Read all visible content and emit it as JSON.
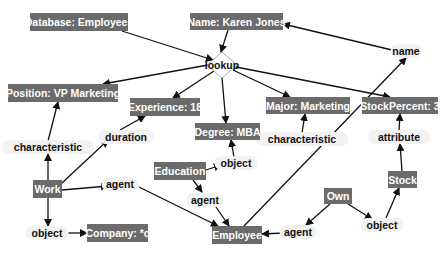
{
  "diagram": {
    "type": "conceptual-graph",
    "concepts": [
      {
        "id": "database",
        "label": "Database: Employees",
        "x": 30,
        "y": 13,
        "w": 98,
        "h": 18
      },
      {
        "id": "name_karen",
        "label": "Name: Karen Jones",
        "x": 190,
        "y": 13,
        "w": 93,
        "h": 17
      },
      {
        "id": "position",
        "label": "Position: VP Marketing",
        "x": 8,
        "y": 84,
        "w": 110,
        "h": 18
      },
      {
        "id": "experience",
        "label": "Experience: 18",
        "x": 130,
        "y": 98,
        "w": 70,
        "h": 18
      },
      {
        "id": "major",
        "label": "Major: Marketing",
        "x": 266,
        "y": 97,
        "w": 84,
        "h": 17
      },
      {
        "id": "stockpercent",
        "label": "StockPercent: 3",
        "x": 362,
        "y": 97,
        "w": 76,
        "h": 17
      },
      {
        "id": "degree",
        "label": "Degree: MBA",
        "x": 195,
        "y": 123,
        "w": 65,
        "h": 17
      },
      {
        "id": "education",
        "label": "Education",
        "x": 154,
        "y": 162,
        "w": 52,
        "h": 18
      },
      {
        "id": "work",
        "label": "Work",
        "x": 33,
        "y": 180,
        "w": 29,
        "h": 18
      },
      {
        "id": "stock",
        "label": "Stock",
        "x": 388,
        "y": 171,
        "w": 29,
        "h": 17
      },
      {
        "id": "own",
        "label": "Own",
        "x": 324,
        "y": 188,
        "w": 28,
        "h": 16
      },
      {
        "id": "company",
        "label": "Company: *c",
        "x": 87,
        "y": 224,
        "w": 61,
        "h": 18
      },
      {
        "id": "employee",
        "label": "Employee",
        "x": 212,
        "y": 226,
        "w": 50,
        "h": 18
      }
    ],
    "actor": {
      "id": "lookup",
      "label": "lookup",
      "cx": 222,
      "cy": 65,
      "rx": 15,
      "ry": 13
    },
    "relations": [
      {
        "id": "rel_name",
        "label": "name",
        "x": 406,
        "y": 51
      },
      {
        "id": "rel_char_left",
        "label": "characteristic",
        "x": 48,
        "y": 147
      },
      {
        "id": "rel_duration",
        "label": "duration",
        "x": 126,
        "y": 137
      },
      {
        "id": "rel_char_right",
        "label": "characteristic",
        "x": 302,
        "y": 139
      },
      {
        "id": "rel_attribute",
        "label": "attribute",
        "x": 399,
        "y": 137
      },
      {
        "id": "rel_object_edu",
        "label": "object",
        "x": 236,
        "y": 163
      },
      {
        "id": "rel_agent_work",
        "label": "agent",
        "x": 120,
        "y": 184
      },
      {
        "id": "rel_agent_edu",
        "label": "agent",
        "x": 205,
        "y": 200
      },
      {
        "id": "rel_object_work",
        "label": "object",
        "x": 47,
        "y": 233
      },
      {
        "id": "rel_agent_own",
        "label": "agent",
        "x": 298,
        "y": 232
      },
      {
        "id": "rel_object_own",
        "label": "object",
        "x": 382,
        "y": 225
      }
    ],
    "edges": [
      {
        "from": [
          122,
          31
        ],
        "to": [
          213,
          60
        ]
      },
      {
        "from": [
          228,
          30
        ],
        "to": [
          221,
          52
        ]
      },
      {
        "from": [
          208,
          65
        ],
        "to": [
          103,
          84
        ]
      },
      {
        "from": [
          214,
          71
        ],
        "to": [
          173,
          98
        ]
      },
      {
        "from": [
          222,
          78
        ],
        "to": [
          226,
          123
        ]
      },
      {
        "from": [
          233,
          70
        ],
        "to": [
          290,
          97
        ]
      },
      {
        "from": [
          236,
          67
        ],
        "to": [
          390,
          97
        ]
      },
      {
        "from": [
          392,
          50
        ],
        "to": [
          283,
          24
        ]
      },
      {
        "from": [
          48,
          141
        ],
        "to": [
          58,
          102
        ]
      },
      {
        "from": [
          120,
          130
        ],
        "to": [
          145,
          116
        ]
      },
      {
        "from": [
          302,
          133
        ],
        "to": [
          305,
          114
        ]
      },
      {
        "from": [
          399,
          131
        ],
        "to": [
          400,
          114
        ]
      },
      {
        "from": [
          48,
          180
        ],
        "to": [
          48,
          154
        ]
      },
      {
        "from": [
          62,
          183
        ],
        "to": [
          108,
          140
        ]
      },
      {
        "from": [
          62,
          190
        ],
        "to": [
          108,
          186
        ]
      },
      {
        "from": [
          48,
          198
        ],
        "to": [
          48,
          226
        ]
      },
      {
        "from": [
          63,
          233
        ],
        "to": [
          87,
          233
        ]
      },
      {
        "from": [
          139,
          187
        ],
        "to": [
          218,
          226
        ]
      },
      {
        "from": [
          206,
          170
        ],
        "to": [
          221,
          165
        ]
      },
      {
        "from": [
          234,
          157
        ],
        "to": [
          231,
          140
        ]
      },
      {
        "from": [
          193,
          180
        ],
        "to": [
          202,
          192
        ]
      },
      {
        "from": [
          216,
          207
        ],
        "to": [
          229,
          226
        ]
      },
      {
        "from": [
          260,
          140
        ],
        "to": [
          276,
          139
        ]
      },
      {
        "from": [
          244,
          226
        ],
        "to": [
          406,
          58
        ]
      },
      {
        "from": [
          284,
          233
        ],
        "to": [
          262,
          234
        ]
      },
      {
        "from": [
          330,
          204
        ],
        "to": [
          306,
          225
        ]
      },
      {
        "from": [
          348,
          204
        ],
        "to": [
          372,
          219
        ]
      },
      {
        "from": [
          386,
          218
        ],
        "to": [
          399,
          188
        ]
      },
      {
        "from": [
          402,
          171
        ],
        "to": [
          400,
          144
        ]
      }
    ],
    "colors": {
      "concept_fill": "#6b6b6b",
      "concept_text": "#ffffff",
      "relation_text": "#111111",
      "edge": "#111111"
    }
  }
}
